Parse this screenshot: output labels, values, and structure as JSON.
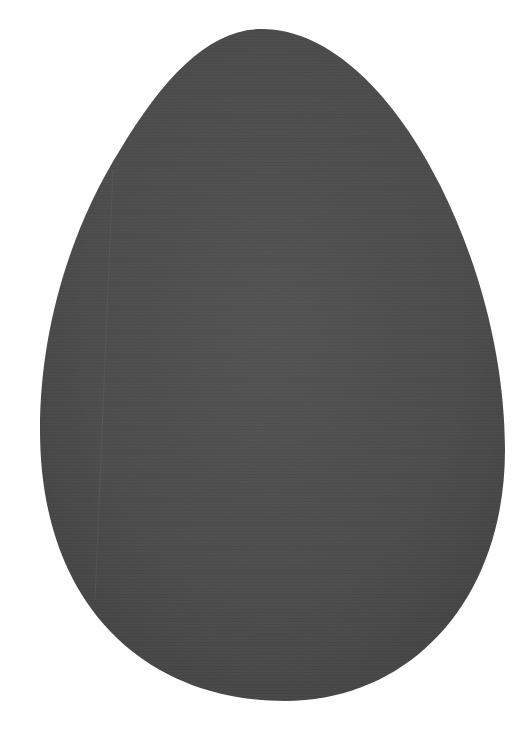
{
  "scene": {
    "description": "Grey textured egg-shaped object on white background",
    "background_color": "#ffffff",
    "object": {
      "shape": "egg",
      "fill_color": "#4f4f4f",
      "highlight_color": "#5a5a5a",
      "edge_color": "#3e3e3e"
    }
  }
}
